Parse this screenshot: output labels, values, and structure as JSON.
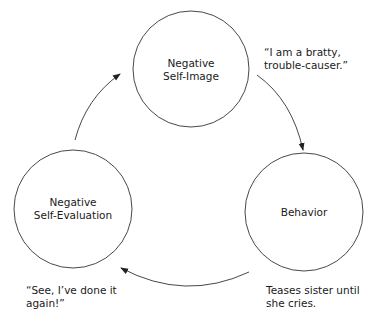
{
  "diagram": {
    "type": "cycle",
    "nodes": [
      {
        "id": "self-image",
        "lines": [
          "Negative",
          "Self-Image"
        ]
      },
      {
        "id": "behavior",
        "lines": [
          "Behavior"
        ]
      },
      {
        "id": "self-evaluation",
        "lines": [
          "Negative",
          "Self-Evaluation"
        ]
      }
    ],
    "annotations": [
      {
        "for": "self-image",
        "lines": [
          "“I am a bratty,",
          "trouble-causer.”"
        ]
      },
      {
        "for": "behavior",
        "lines": [
          "Teases sister until",
          "she cries."
        ]
      },
      {
        "for": "self-evaluation",
        "lines": [
          "“See, I’ve done it",
          "again!”"
        ]
      }
    ],
    "edges": [
      {
        "from": "self-image",
        "to": "behavior"
      },
      {
        "from": "behavior",
        "to": "self-evaluation"
      },
      {
        "from": "self-evaluation",
        "to": "self-image"
      }
    ],
    "colors": {
      "stroke": "#333333",
      "text": "#1a1a1a",
      "background": "#ffffff"
    }
  }
}
